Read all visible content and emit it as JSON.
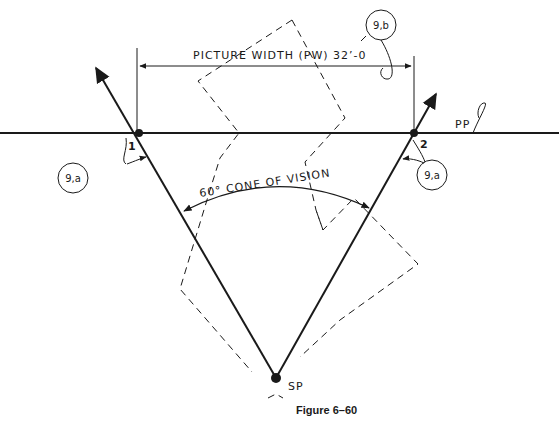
{
  "figure": {
    "caption": "Figure 6–60",
    "colors": {
      "ink": "#1a1a1a",
      "background": "#ffffff"
    }
  },
  "labels": {
    "picture_width": "PICTURE WIDTH (PW) 32’-0",
    "cone_of_vision": "60° CONE OF VISION",
    "picture_plane": "PP",
    "station_point": "SP",
    "point_1": "1",
    "point_2": "2",
    "callout_left": "9,a",
    "callout_right": "9,a",
    "callout_top": "9,b"
  },
  "geometry": {
    "picture_plane_y": 133,
    "point_1": [
      139,
      133
    ],
    "point_2": [
      414,
      133
    ],
    "station_point": [
      276,
      378
    ],
    "dimension_line_y": 66,
    "cone_angle_deg": 60
  }
}
